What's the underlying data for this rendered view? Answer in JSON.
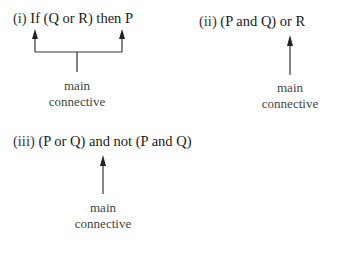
{
  "items": [
    {
      "number": "(i)",
      "formula": "If (Q or R) then P",
      "label_line1": "main",
      "label_line2": "connective"
    },
    {
      "number": "(ii)",
      "formula": "(P and Q) or R",
      "label_line1": "main",
      "label_line2": "connective"
    },
    {
      "number": "(iii)",
      "formula": "(P or Q) and not (P and Q)",
      "label_line1": "main",
      "label_line2": "connective"
    }
  ],
  "colors": {
    "text": "#1a1a1a",
    "arrow": "#222222",
    "label": "#444444"
  }
}
